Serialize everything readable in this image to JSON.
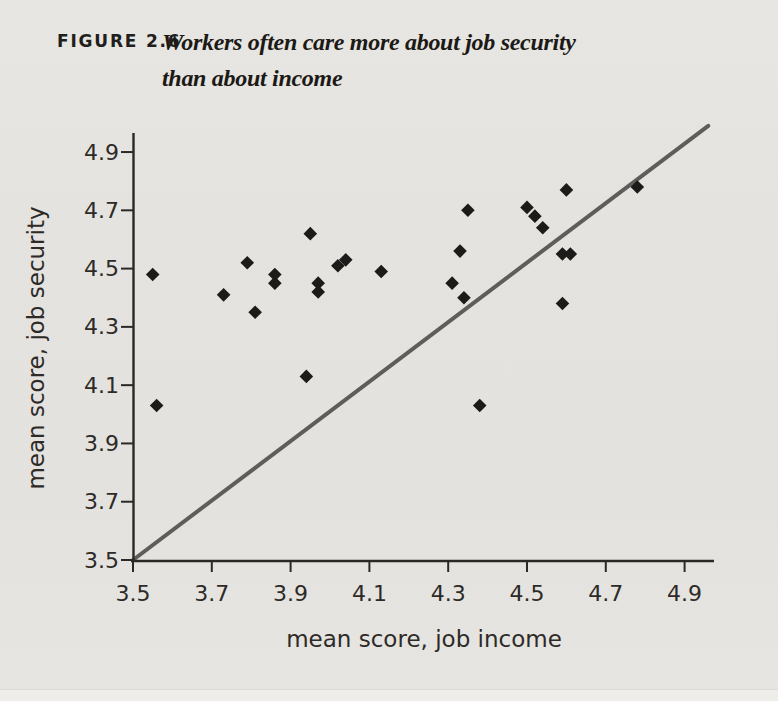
{
  "page": {
    "background": "#e4e3df"
  },
  "figure": {
    "label": "FIGURE 2.6",
    "title_line1": "Workers often care more about job security",
    "title_line2": "than about income"
  },
  "chart_data": {
    "type": "scatter",
    "title": "Workers often care more about job security than about income",
    "xlabel": "mean score, job income",
    "ylabel": "mean score, job security",
    "xlim": [
      3.5,
      5.0
    ],
    "ylim": [
      3.5,
      5.0
    ],
    "xticks": [
      "3.5",
      "3.7",
      "3.9",
      "4.1",
      "4.3",
      "4.5",
      "4.7",
      "4.9"
    ],
    "yticks": [
      "3.5",
      "3.7",
      "3.9",
      "4.1",
      "4.3",
      "4.5",
      "4.7",
      "4.9"
    ],
    "grid": false,
    "legend": "none",
    "marker": "diamond",
    "marker_color": "#1d1b19",
    "axis_color": "#2b2927",
    "label_color": "#2d2a27",
    "identity_line": {
      "x1": 3.5,
      "y1": 3.5,
      "x2": 4.96,
      "y2": 4.99,
      "color": "#5e5d5b"
    },
    "points": [
      [
        3.55,
        4.48
      ],
      [
        3.56,
        4.03
      ],
      [
        3.73,
        4.41
      ],
      [
        3.79,
        4.52
      ],
      [
        3.81,
        4.35
      ],
      [
        3.86,
        4.48
      ],
      [
        3.86,
        4.45
      ],
      [
        3.95,
        4.62
      ],
      [
        3.94,
        4.13
      ],
      [
        3.97,
        4.45
      ],
      [
        3.97,
        4.42
      ],
      [
        4.02,
        4.51
      ],
      [
        4.04,
        4.53
      ],
      [
        4.13,
        4.49
      ],
      [
        4.31,
        4.45
      ],
      [
        4.33,
        4.56
      ],
      [
        4.34,
        4.4
      ],
      [
        4.35,
        4.7
      ],
      [
        4.38,
        4.03
      ],
      [
        4.5,
        4.71
      ],
      [
        4.52,
        4.68
      ],
      [
        4.54,
        4.64
      ],
      [
        4.59,
        4.55
      ],
      [
        4.59,
        4.38
      ],
      [
        4.6,
        4.77
      ],
      [
        4.61,
        4.55
      ],
      [
        4.78,
        4.78
      ]
    ]
  }
}
